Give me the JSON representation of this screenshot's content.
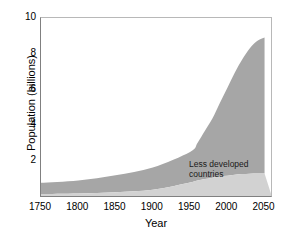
{
  "chart_data": {
    "type": "area",
    "title": "",
    "subtitle": "",
    "xlabel": "Year",
    "ylabel": "Population (billions)",
    "xlim": [
      1750,
      2060
    ],
    "ylim": [
      0,
      10
    ],
    "grid": false,
    "stacked": true,
    "legend_position": "inline-annotation",
    "x_ticks": [
      1750,
      1800,
      1850,
      1900,
      1950,
      2000,
      2050
    ],
    "x_tick_labels": [
      "1750",
      "1800",
      "1850",
      "1900",
      "1950",
      "2000",
      "2050"
    ],
    "y_ticks": [
      2,
      4,
      6,
      8,
      10
    ],
    "y_tick_labels": [
      "2",
      "4",
      "6",
      "8",
      "10"
    ],
    "x": [
      1750,
      1800,
      1850,
      1900,
      1950,
      1960,
      1970,
      1980,
      1990,
      2000,
      2010,
      2020,
      2030,
      2040,
      2050
    ],
    "series": [
      {
        "name": "More developed countries",
        "color": "#d2d2d2",
        "values": [
          0.17,
          0.2,
          0.27,
          0.4,
          0.81,
          0.92,
          1.0,
          1.08,
          1.15,
          1.19,
          1.24,
          1.28,
          1.3,
          1.31,
          1.31
        ]
      },
      {
        "name": "Less developed countries",
        "color": "#a6a6a6",
        "values": [
          0.62,
          0.72,
          0.94,
          1.25,
          1.71,
          2.1,
          2.7,
          3.3,
          4.1,
          4.9,
          5.7,
          6.4,
          7.0,
          7.4,
          7.6
        ]
      }
    ],
    "totals": [
      0.79,
      0.92,
      1.21,
      1.65,
      2.52,
      3.02,
      3.7,
      4.38,
      5.25,
      6.09,
      6.94,
      7.68,
      8.3,
      8.71,
      8.91
    ],
    "annotations": [
      {
        "name": "less-developed-label",
        "text": "Less developed\ncountries",
        "x": 1985,
        "y": 2.9
      },
      {
        "name": "more-developed-label",
        "text": "More developed countries",
        "x": 1965,
        "y": 0.55
      }
    ],
    "colors": {
      "less_developed": "#a6a6a6",
      "more_developed": "#d2d2d2",
      "axis": "#808080",
      "text": "#000000",
      "background": "#ffffff"
    }
  }
}
